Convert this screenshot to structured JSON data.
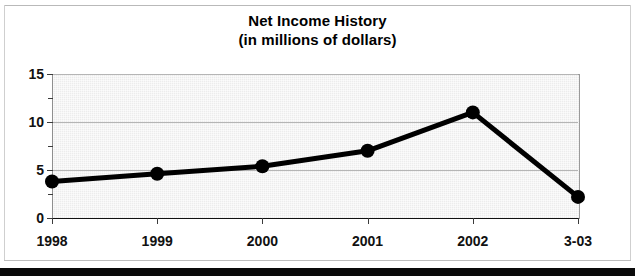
{
  "chart_data": {
    "type": "line",
    "title": "Net Income History",
    "subtitle": "(in millions of dollars)",
    "xlabel": "",
    "ylabel": "",
    "categories": [
      "1998",
      "1999",
      "2000",
      "2001",
      "2002",
      "3-03"
    ],
    "values": [
      3.8,
      4.6,
      5.4,
      7.0,
      11.0,
      2.2
    ],
    "series": [
      {
        "name": "Net Income",
        "values": [
          3.8,
          4.6,
          5.4,
          7.0,
          11.0,
          2.2
        ]
      }
    ],
    "ylim": [
      0,
      15
    ],
    "yticks": [
      "0",
      "5",
      "10",
      "15"
    ],
    "ytick_values": [
      0,
      5,
      10,
      15
    ],
    "minor_ytick_values": [
      2.5,
      7.5,
      12.5
    ],
    "grid": true,
    "legend": "none",
    "line_color": "#000000",
    "marker": "circle",
    "marker_color": "#000000",
    "plot_background": "#ececec"
  },
  "figure": {
    "title_line1": "Net Income History",
    "title_line2": "(in millions of dollars)"
  }
}
